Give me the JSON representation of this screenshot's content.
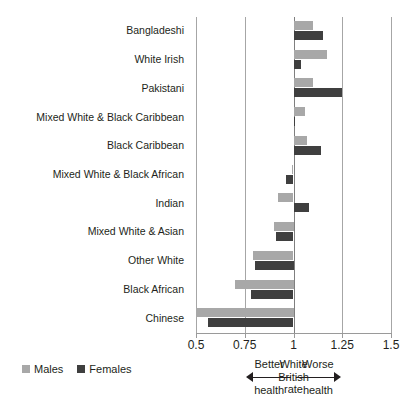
{
  "title_fragment": "",
  "legend": {
    "position": "bottom-left",
    "items": [
      {
        "label": "Males",
        "color": "#a8a8a8"
      },
      {
        "label": "Females",
        "color": "#3f3f3f"
      }
    ]
  },
  "axis": {
    "ticks": [
      "0.5",
      "0.75",
      "1",
      "1.25",
      "1.5"
    ],
    "tick_values": [
      0.5,
      0.75,
      1,
      1.25,
      1.5
    ],
    "min": 0.5,
    "max": 1.5,
    "reference_value": 1
  },
  "annotations": {
    "better": "Better\nhealth",
    "reference": "White\nBritish\nrate",
    "worse": "Worse\nhealth"
  },
  "chart_data": {
    "type": "bar",
    "orientation": "horizontal",
    "title": "",
    "xlabel": "",
    "ylabel": "",
    "xlim": [
      0.5,
      1.5
    ],
    "grid": true,
    "grid_axis": "x",
    "reference_line": 1,
    "legend_position": "bottom-left",
    "categories": [
      "Bangladeshi",
      "White Irish",
      "Pakistani",
      "Mixed White & Black Caribbean",
      "Black Caribbean",
      "Mixed White & Black African",
      "Indian",
      "Mixed White & Asian",
      "Other White",
      "Black African",
      "Chinese"
    ],
    "series": [
      {
        "name": "Males",
        "color": "#a8a8a8",
        "values": [
          1.1,
          1.17,
          1.1,
          1.06,
          1.07,
          0.99,
          0.92,
          0.9,
          0.79,
          0.7,
          0.5
        ]
      },
      {
        "name": "Females",
        "color": "#3f3f3f",
        "values": [
          1.15,
          1.04,
          1.25,
          1.01,
          1.14,
          0.96,
          1.08,
          0.91,
          0.8,
          0.78,
          0.56
        ]
      }
    ]
  }
}
